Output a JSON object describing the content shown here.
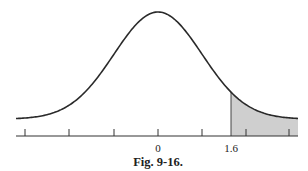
{
  "figure": {
    "caption": "Fig. 9-16.",
    "colors": {
      "curve": "#2a2a2a",
      "axis": "#333333",
      "shade": "#cfcfcf",
      "text": "#222222"
    }
  },
  "chart_data": {
    "type": "area",
    "title": "",
    "caption": "Fig. 9-16.",
    "xlabel": "",
    "ylabel": "",
    "x_range": [
      -3.2,
      3.2
    ],
    "mean": 0,
    "sd": 1,
    "tick_positions": [
      -3,
      -2,
      -1,
      0,
      1,
      2,
      3
    ],
    "tick_labels": [
      {
        "x": 0,
        "label": "0"
      },
      {
        "x": 1.6,
        "label": "1.6"
      }
    ],
    "shaded_region": {
      "from": 1.6,
      "to": 3.2,
      "side": "right-tail"
    },
    "grid": false,
    "legend": null
  }
}
